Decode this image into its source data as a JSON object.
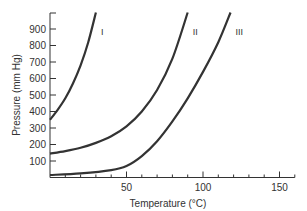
{
  "chart_data": {
    "type": "line",
    "title": "",
    "xlabel": "Temperature (°C)",
    "ylabel": "Pressure (mm Hg)",
    "xlim": [
      0,
      160
    ],
    "ylim": [
      0,
      1000
    ],
    "xticks": [
      50,
      100,
      150
    ],
    "xtick_labels": [
      "50",
      "100",
      "150"
    ],
    "xminor_step": 10,
    "yticks": [
      100,
      200,
      300,
      400,
      500,
      600,
      700,
      800,
      900
    ],
    "ytick_labels": [
      "100",
      "200",
      "300",
      "400",
      "500",
      "600",
      "700",
      "800",
      "900"
    ],
    "grid": false,
    "series": [
      {
        "name": "I",
        "x": [
          0,
          5,
          10,
          15,
          20,
          25,
          30
        ],
        "y": [
          350,
          410,
          480,
          570,
          680,
          820,
          1000
        ]
      },
      {
        "name": "II",
        "x": [
          0,
          10,
          20,
          30,
          40,
          50,
          60,
          70,
          80,
          90
        ],
        "y": [
          145,
          160,
          180,
          210,
          250,
          310,
          400,
          530,
          720,
          1000
        ]
      },
      {
        "name": "III",
        "x": [
          0,
          20,
          40,
          50,
          60,
          70,
          80,
          90,
          100,
          110,
          118
        ],
        "y": [
          15,
          25,
          45,
          70,
          130,
          220,
          340,
          480,
          640,
          820,
          1000
        ]
      }
    ]
  }
}
